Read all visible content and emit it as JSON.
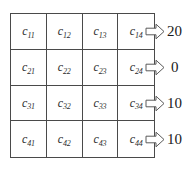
{
  "diagram": {
    "type": "matrix-with-row-outputs",
    "title": "",
    "matrix": {
      "rows": 4,
      "cols": 4,
      "cells": [
        [
          {
            "symbol": "c",
            "subscript": "11"
          },
          {
            "symbol": "c",
            "subscript": "12"
          },
          {
            "symbol": "c",
            "subscript": "13"
          },
          {
            "symbol": "c",
            "subscript": "14"
          }
        ],
        [
          {
            "symbol": "c",
            "subscript": "21"
          },
          {
            "symbol": "c",
            "subscript": "22"
          },
          {
            "symbol": "c",
            "subscript": "23"
          },
          {
            "symbol": "c",
            "subscript": "24"
          }
        ],
        [
          {
            "symbol": "c",
            "subscript": "31"
          },
          {
            "symbol": "c",
            "subscript": "32"
          },
          {
            "symbol": "c",
            "subscript": "33"
          },
          {
            "symbol": "c",
            "subscript": "34"
          }
        ],
        [
          {
            "symbol": "c",
            "subscript": "41"
          },
          {
            "symbol": "c",
            "subscript": "42"
          },
          {
            "symbol": "c",
            "subscript": "43"
          },
          {
            "symbol": "c",
            "subscript": "44"
          }
        ]
      ]
    },
    "row_outputs": [
      {
        "icon": "right-arrow-icon",
        "value": "20"
      },
      {
        "icon": "right-arrow-icon",
        "value": "0"
      },
      {
        "icon": "right-arrow-icon",
        "value": "10"
      },
      {
        "icon": "right-arrow-icon",
        "value": "10"
      }
    ],
    "colors": {
      "line": "#4a4a4a",
      "text": "#2b2b2b",
      "value_text": "#1a1a1a",
      "background": "#ffffff",
      "arrow_stroke": "#5a5a5a",
      "arrow_fill": "#ffffff"
    }
  }
}
